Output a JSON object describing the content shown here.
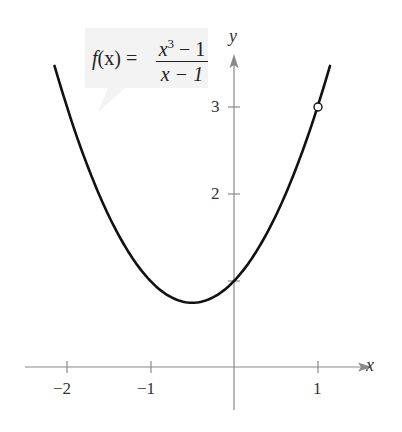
{
  "chart_data": {
    "type": "line",
    "title": "",
    "function_label": {
      "lhs": "f(x) =",
      "numerator": "x³ − 1",
      "denominator": "x − 1"
    },
    "xlabel": "x",
    "ylabel": "y",
    "x_ticks": [
      "−2",
      "−1",
      "1"
    ],
    "y_ticks": [
      "2",
      "3"
    ],
    "xlim": [
      -2.15,
      1.6
    ],
    "ylim": [
      -0.75,
      3.9
    ],
    "grid": false,
    "series": [
      {
        "name": "f(x) = (x^3 - 1)/(x - 1) = x^2 + x + 1, x ≠ 1",
        "x": [
          -2.15,
          -2.0,
          -1.5,
          -1.0,
          -0.5,
          0.0,
          0.5,
          1.0,
          1.15
        ],
        "y": [
          3.47,
          3.0,
          1.75,
          1.0,
          0.75,
          1.0,
          1.75,
          3.0,
          3.47
        ]
      }
    ],
    "annotations": [
      {
        "type": "open-circle",
        "x": 1,
        "y": 3,
        "note": "hole (discontinuity)"
      }
    ],
    "vertex": {
      "x": -0.5,
      "y": 0.75
    }
  },
  "labels": {
    "lhs_f": "f",
    "lhs_paren": "(x) =",
    "num_x": "x",
    "num_exp": "3",
    "num_rest": " − 1",
    "den": "x − 1",
    "x_axis": "x",
    "y_axis": "y",
    "tick_x_m2": "−2",
    "tick_x_m1": "−1",
    "tick_x_1": "1",
    "tick_y_2": "2",
    "tick_y_3": "3"
  },
  "colors": {
    "curve": "#111111",
    "axis": "#8a8a8a",
    "label_box": "#f3f3f3"
  }
}
